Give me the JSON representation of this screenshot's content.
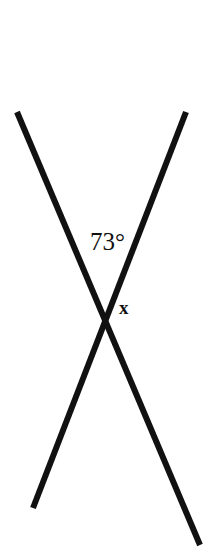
{
  "figure": {
    "background_color": "#ffffff",
    "stroke_color": "#111111",
    "stroke_width": 6,
    "width": 214,
    "height": 552
  },
  "labels": {
    "angle_measure": "73°",
    "unknown_angle": "x"
  },
  "chart_data": {
    "type": "diagram",
    "subtype": "geometry-intersecting-lines",
    "title": "",
    "background": "#ffffff",
    "lines": [
      {
        "name": "line-descending-right",
        "x1": 17,
        "y1": 112,
        "x2": 200,
        "y2": 545,
        "color": "#111111",
        "width": 6
      },
      {
        "name": "line-descending-left",
        "x1": 186,
        "y1": 112,
        "x2": 33,
        "y2": 508,
        "color": "#111111",
        "width": 6
      }
    ],
    "intersection": {
      "x": 107,
      "y": 310
    },
    "annotations": [
      {
        "name": "angle-73",
        "text": "73°",
        "x": 90,
        "y": 229,
        "position": "above-intersection",
        "describes": "upper vertical angle between the two lines"
      },
      {
        "name": "angle-x",
        "text": "x",
        "x": 119,
        "y": 298,
        "position": "right-of-intersection",
        "describes": "right angle adjacent to the 73 degree angle"
      }
    ]
  }
}
